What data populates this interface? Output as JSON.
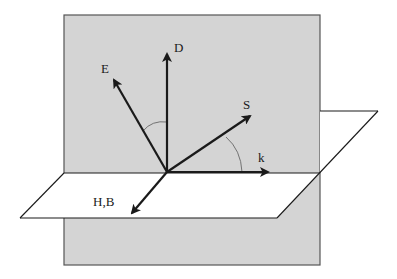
{
  "diagram": {
    "title": "",
    "colors": {
      "vertical_plane_fill": "#d4d4d4",
      "vertical_plane_stroke": "#555555",
      "horizontal_plane_fill": "#ffffff",
      "line": "#1a1a1a",
      "arc": "#666666"
    },
    "vectors": [
      {
        "id": "D",
        "label": "D"
      },
      {
        "id": "E",
        "label": "E"
      },
      {
        "id": "S",
        "label": "S"
      },
      {
        "id": "k",
        "label": "k"
      },
      {
        "id": "HB",
        "label": "H,B"
      }
    ],
    "angles": [
      {
        "between": [
          "E",
          "D"
        ]
      },
      {
        "between": [
          "S",
          "k"
        ]
      }
    ]
  }
}
